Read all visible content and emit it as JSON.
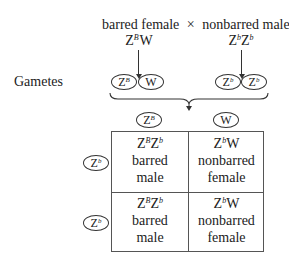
{
  "cross": {
    "female_label": "barred female",
    "cross_symbol": "×",
    "male_label": "nonbarred male",
    "female_genotype": {
      "base1": "Z",
      "sup1": "B",
      "base2": "W"
    },
    "male_genotype": {
      "base1": "Z",
      "sup1": "b",
      "base2": "Z",
      "sup2": "b"
    }
  },
  "gametes": {
    "label": "Gametes",
    "female": [
      {
        "base": "Z",
        "sup": "B"
      },
      {
        "base": "W",
        "sup": ""
      }
    ],
    "male": [
      {
        "base": "Z",
        "sup": "b"
      },
      {
        "base": "Z",
        "sup": "b"
      }
    ]
  },
  "punnett": {
    "col_headers": [
      {
        "base": "Z",
        "sup": "B"
      },
      {
        "base": "W",
        "sup": ""
      }
    ],
    "row_headers": [
      {
        "base": "Z",
        "sup": "b"
      },
      {
        "base": "Z",
        "sup": "b"
      }
    ],
    "cells": [
      [
        {
          "g1": "Z",
          "s1": "B",
          "g2": "Z",
          "s2": "b",
          "line1": "barred",
          "line2": "male"
        },
        {
          "g1": "Z",
          "s1": "b",
          "g2": "W",
          "s2": "",
          "line1": "nonbarred",
          "line2": "female"
        }
      ],
      [
        {
          "g1": "Z",
          "s1": "B",
          "g2": "Z",
          "s2": "b",
          "line1": "barred",
          "line2": "male"
        },
        {
          "g1": "Z",
          "s1": "b",
          "g2": "W",
          "s2": "",
          "line1": "nonbarred",
          "line2": "female"
        }
      ]
    ]
  }
}
